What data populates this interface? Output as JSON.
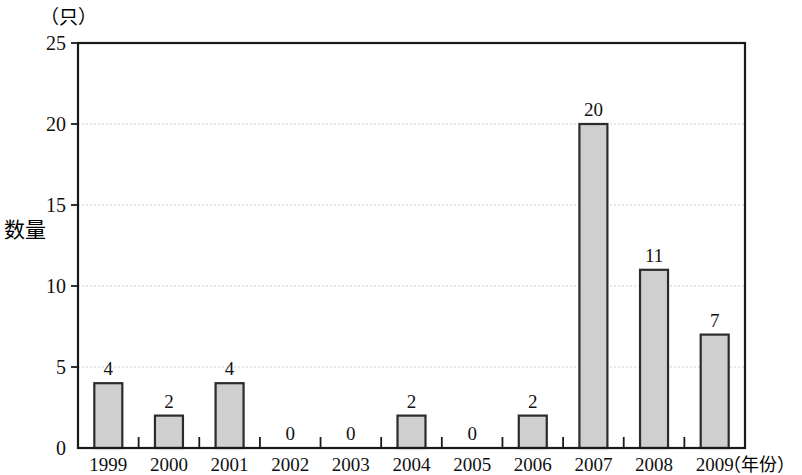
{
  "chart_data": {
    "type": "bar",
    "title": "",
    "subtitle": "",
    "unit_label": "（只）",
    "ylabel": "数量",
    "xlabel": "（年份）",
    "categories": [
      "1999",
      "2000",
      "2001",
      "2002",
      "2003",
      "2004",
      "2005",
      "2006",
      "2007",
      "2008",
      "2009"
    ],
    "values": [
      4,
      2,
      4,
      0,
      0,
      2,
      0,
      2,
      20,
      11,
      7
    ],
    "value_labels": [
      "4",
      "2",
      "4",
      "0",
      "0",
      "2",
      "0",
      "2",
      "20",
      "11",
      "7"
    ],
    "ylim": [
      0,
      25
    ],
    "yticks": [
      0,
      5,
      10,
      15,
      20,
      25
    ],
    "ytick_labels": [
      "0",
      "5",
      "10",
      "15",
      "20",
      "25"
    ],
    "grid": true,
    "legend": "none",
    "colors": {
      "bar_fill": "#cfcfcf",
      "bar_stroke": "#2b2b2b",
      "axis": "#1a1a1a",
      "grid": "#cfcfcf",
      "background": "#ffffff",
      "text": "#111111"
    }
  }
}
